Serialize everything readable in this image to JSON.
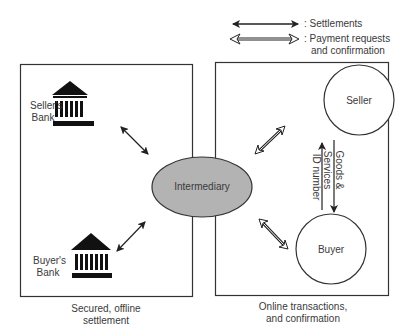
{
  "legend": {
    "settlements": ": Settlements",
    "payment_line1": ": Payment requests",
    "payment_line2": "and confirmation"
  },
  "left_box": {
    "seller_bank_line1": "Seller's",
    "seller_bank_line2": "Bank",
    "buyer_bank_line1": "Buyer's",
    "buyer_bank_line2": "Bank",
    "caption_line1": "Secured, offline",
    "caption_line2": "settlement"
  },
  "center": {
    "label": "Intermediary",
    "fill": "#b3b3b3"
  },
  "right_box": {
    "seller_label": "Seller",
    "buyer_label": "Buyer",
    "id_number_label": "ID number",
    "goods_line1": "Goods &",
    "goods_line2": "Services",
    "caption_line1": "Online transactions,",
    "caption_line2": "and confirmation"
  }
}
